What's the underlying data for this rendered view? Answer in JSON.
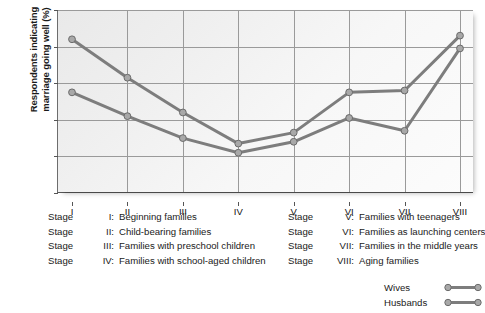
{
  "chart_data": {
    "type": "line",
    "title": "",
    "xlabel": "",
    "ylabel": "Respondents indicating marriage going well (%)",
    "ylabel_line1": "Respondents indicating",
    "ylabel_line2": "marriage going well (%)",
    "categories": [
      "I",
      "II",
      "III",
      "IV",
      "V",
      "VI",
      "VII",
      "VIII"
    ],
    "ylim": [
      0,
      50
    ],
    "yticks": [
      0,
      10,
      20,
      30,
      40,
      50
    ],
    "grid": true,
    "legend_position": "bottom-right",
    "series": [
      {
        "name": "Wives",
        "values": [
          42.0,
          31.5,
          22.0,
          13.5,
          16.5,
          27.5,
          28.0,
          43.0
        ],
        "color": "#7d7d7d"
      },
      {
        "name": "Husbands",
        "values": [
          27.5,
          21.0,
          15.0,
          11.0,
          14.0,
          20.5,
          17.0,
          39.5
        ],
        "color": "#7d7d7d"
      }
    ]
  },
  "axis": {
    "y_tick_labels": [
      "50",
      "40",
      "30",
      "20",
      "10",
      "0"
    ],
    "x_tick_labels": [
      "I",
      "II",
      "III",
      "IV",
      "V",
      "VI",
      "VII",
      "VIII"
    ]
  },
  "stage_key_left": [
    {
      "word": "Stage",
      "numeral": "I:",
      "description": "Beginning families"
    },
    {
      "word": "Stage",
      "numeral": "II:",
      "description": "Child-bearing families"
    },
    {
      "word": "Stage",
      "numeral": "III:",
      "description": "Families with preschool children"
    },
    {
      "word": "Stage",
      "numeral": "IV:",
      "description": "Families with school-aged children"
    }
  ],
  "stage_key_right": [
    {
      "word": "Stage",
      "numeral": "V:",
      "description": "Families with teenagers"
    },
    {
      "word": "Stage",
      "numeral": "VI:",
      "description": "Families as launching centers"
    },
    {
      "word": "Stage",
      "numeral": "VII:",
      "description": "Families in the middle years"
    },
    {
      "word": "Stage",
      "numeral": "VIII:",
      "description": "Aging families"
    }
  ],
  "legend": [
    {
      "label": "Wives"
    },
    {
      "label": "Husbands"
    }
  ]
}
